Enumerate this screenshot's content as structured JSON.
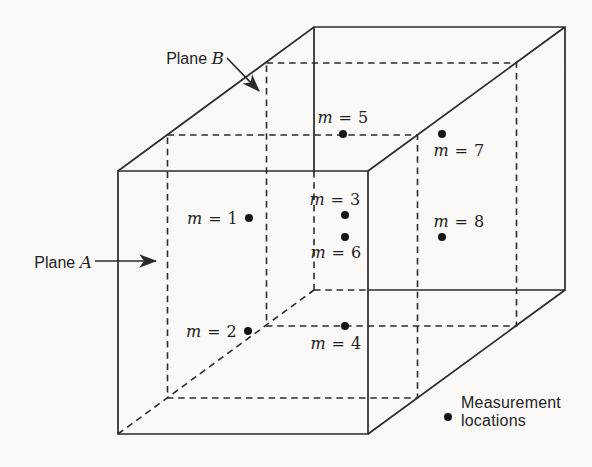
{
  "colors": {
    "background": "#faf9f7",
    "line": "#2b2b2b",
    "text": "#1f1f1f",
    "dot": "#151515"
  },
  "plane_a": {
    "word": "Plane",
    "letter": "A"
  },
  "plane_b": {
    "word": "Plane",
    "letter": "B"
  },
  "legend": {
    "line1": "Measurement",
    "line2": "locations"
  },
  "points": [
    {
      "id": 1,
      "label": "m = 1",
      "dot_x": 249,
      "dot_y": 218,
      "anchor_x": 238,
      "anchor_y": 218,
      "align": "right-middle"
    },
    {
      "id": 2,
      "label": "m = 2",
      "dot_x": 248,
      "dot_y": 331,
      "anchor_x": 237,
      "anchor_y": 331,
      "align": "right-middle"
    },
    {
      "id": 3,
      "label": "m = 3",
      "dot_x": 345,
      "dot_y": 215,
      "anchor_x": 335,
      "anchor_y": 209,
      "align": "center-bottom"
    },
    {
      "id": 4,
      "label": "m = 4",
      "dot_x": 345,
      "dot_y": 326,
      "anchor_x": 336,
      "anchor_y": 334,
      "align": "center-top"
    },
    {
      "id": 5,
      "label": "m = 5",
      "dot_x": 343,
      "dot_y": 134,
      "anchor_x": 343,
      "anchor_y": 127,
      "align": "center-bottom"
    },
    {
      "id": 6,
      "label": "m = 6",
      "dot_x": 345,
      "dot_y": 237,
      "anchor_x": 336,
      "anchor_y": 243,
      "align": "center-top"
    },
    {
      "id": 7,
      "label": "m = 7",
      "dot_x": 442,
      "dot_y": 134,
      "anchor_x": 459,
      "anchor_y": 141,
      "align": "center-top"
    },
    {
      "id": 8,
      "label": "m = 8",
      "dot_x": 442,
      "dot_y": 237,
      "anchor_x": 459,
      "anchor_y": 231,
      "align": "center-bottom"
    }
  ]
}
